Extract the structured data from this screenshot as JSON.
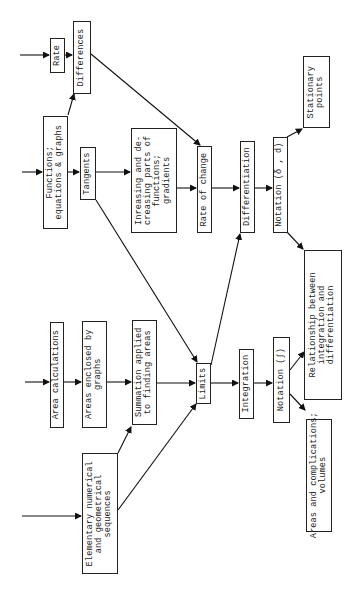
{
  "diagram": {
    "title": "",
    "orientation": "rotated-90-ccw",
    "nodes": {
      "rate": "Rate",
      "differences": "Differences",
      "functions": "Functions;\nequations & graphs",
      "tangents": "Tangents",
      "increasing": "Inreasing and de-\ncreasing parts of\nfunctions;\ngradients",
      "rate_of_change": "Rate of change",
      "differentiation": "Differentiation",
      "notation_diff": "Notation (δ , d)",
      "stationary_points": "Stationary\npoints",
      "relationship": "Relationship between\nintegration and\ndifferentiation",
      "area_calculations": "Area calculations",
      "areas_enclosed": "Areas enclosed by\ngraphs",
      "summation": "Summation applied\nto finding areas",
      "elementary_sequences": "Elementary numerical\nand geometrical\nsequences",
      "limits": "Limits",
      "integration": "Integration",
      "notation_int": "Notation (∫)",
      "areas_complications": "Areas and complications;\nvolumes"
    },
    "edges": [
      [
        "entry",
        "rate"
      ],
      [
        "rate",
        "differences"
      ],
      [
        "functions",
        "differences"
      ],
      [
        "differences",
        "rate_of_change"
      ],
      [
        "entry",
        "functions"
      ],
      [
        "functions",
        "tangents"
      ],
      [
        "tangents",
        "increasing"
      ],
      [
        "increasing",
        "rate_of_change"
      ],
      [
        "tangents",
        "limits"
      ],
      [
        "rate_of_change",
        "differentiation"
      ],
      [
        "differentiation",
        "notation_diff"
      ],
      [
        "notation_diff",
        "stationary_points"
      ],
      [
        "notation_diff",
        "relationship"
      ],
      [
        "entry",
        "area_calculations"
      ],
      [
        "area_calculations",
        "areas_enclosed"
      ],
      [
        "areas_enclosed",
        "summation"
      ],
      [
        "summation",
        "limits"
      ],
      [
        "entry",
        "elementary_sequences"
      ],
      [
        "elementary_sequences",
        "summation"
      ],
      [
        "elementary_sequences",
        "limits"
      ],
      [
        "limits",
        "differentiation"
      ],
      [
        "limits",
        "integration"
      ],
      [
        "integration",
        "notation_int"
      ],
      [
        "notation_int",
        "relationship"
      ],
      [
        "notation_int",
        "areas_complications"
      ]
    ]
  }
}
